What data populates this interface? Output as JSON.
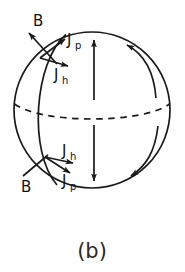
{
  "figure": {
    "caption": "(b)",
    "kind": "sphere-current-diagram",
    "background_color": "#ffffff",
    "stroke_color": "#1a1a1a",
    "sphere": {
      "center_x": 92,
      "center_y": 110,
      "radius": 78,
      "equator_style": "dashed"
    },
    "labels": {
      "top_B": "B",
      "top_Jp_main": "J",
      "top_Jp_sub": "p",
      "top_Jh_main": "J",
      "top_Jh_sub": "h",
      "bottom_Jh_main": "J",
      "bottom_Jh_sub": "h",
      "bottom_Jp_main": "J",
      "bottom_Jp_sub": "p",
      "bottom_B": "B"
    },
    "arrows": {
      "north_axial": "up",
      "south_axial": "down",
      "right_upper_curved": "toward-north-pole",
      "right_lower_curved": "toward-south-pole",
      "top_B_direction": "up-left",
      "top_Jp_direction": "up-right",
      "top_Jh_direction": "right",
      "bottom_Jh_direction": "right",
      "bottom_Jp_direction": "down-right",
      "bottom_B_direction": "down-left"
    }
  }
}
